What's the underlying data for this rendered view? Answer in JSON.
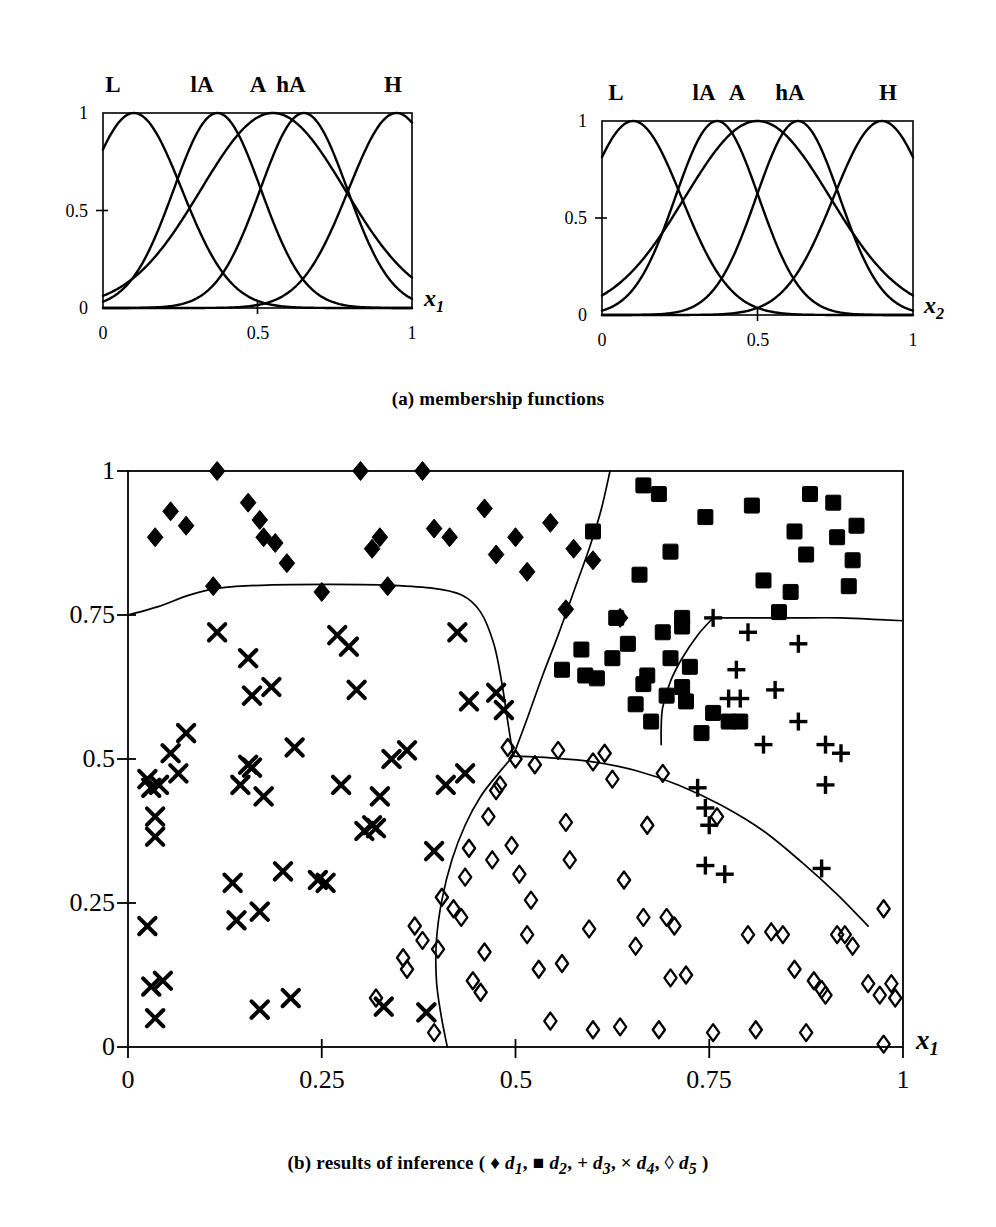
{
  "figure": {
    "caption_a": "(a) membership functions",
    "caption_b_prefix": "(b) results of  inference ( ",
    "caption_b_suffix": " )",
    "caption_b_full": "(b) results of inference ( ♦ d1, ■ d2, + d3, × d4, ◊ d5 )"
  },
  "membership_panels": [
    {
      "name": "membership-x1",
      "axis_label": "x",
      "axis_sub": "1",
      "y_ticks": [
        "0",
        "0.5",
        "1"
      ],
      "y_tick_values": [
        0,
        0.5,
        1
      ],
      "x_ticks": [
        "0",
        "0.5",
        "1"
      ],
      "x_tick_values": [
        0,
        0.5,
        1
      ],
      "set_labels": [
        "L",
        "lA",
        "A",
        "hA",
        "H"
      ],
      "set_label_positions": [
        0.09,
        0.37,
        0.52,
        0.64,
        0.94
      ],
      "centers": [
        0.1,
        0.37,
        0.55,
        0.65,
        0.95
      ],
      "widths": [
        0.22,
        0.2,
        0.33,
        0.2,
        0.22
      ]
    },
    {
      "name": "membership-x2",
      "axis_label": "x",
      "axis_sub": "2",
      "y_ticks": [
        "0",
        "0.5",
        "1"
      ],
      "y_tick_values": [
        0,
        0.5,
        1
      ],
      "x_ticks": [
        "0",
        "0.5",
        "1"
      ],
      "x_tick_values": [
        0,
        0.5,
        1
      ],
      "set_labels": [
        "L",
        "lA",
        "A",
        "hA",
        "H"
      ],
      "set_label_positions": [
        0.1,
        0.37,
        0.47,
        0.62,
        0.9
      ],
      "centers": [
        0.1,
        0.37,
        0.5,
        0.63,
        0.9
      ],
      "widths": [
        0.22,
        0.19,
        0.33,
        0.19,
        0.22
      ]
    }
  ],
  "chart_data": {
    "type": "scatter",
    "title": "",
    "xlabel": "x1",
    "ylabel": "x2",
    "xlim": [
      0,
      1
    ],
    "ylim": [
      0,
      1
    ],
    "grid": false,
    "x_ticks": [
      "0",
      "0.25",
      "0.5",
      "0.75",
      "1"
    ],
    "x_tick_values": [
      0,
      0.25,
      0.5,
      0.75,
      1
    ],
    "y_ticks": [
      "0",
      "0.25",
      "0.5",
      "0.75",
      "1"
    ],
    "y_tick_values": [
      0,
      0.25,
      0.5,
      0.75,
      1
    ],
    "legend_position": "below",
    "series": [
      {
        "name": "d1",
        "label": "d1",
        "marker": "filled-diamond",
        "color": "#000000",
        "points": [
          [
            0.035,
            0.885
          ],
          [
            0.055,
            0.93
          ],
          [
            0.075,
            0.905
          ],
          [
            0.11,
            0.8
          ],
          [
            0.115,
            1.0
          ],
          [
            0.155,
            0.945
          ],
          [
            0.17,
            0.915
          ],
          [
            0.175,
            0.885
          ],
          [
            0.19,
            0.875
          ],
          [
            0.205,
            0.84
          ],
          [
            0.25,
            0.79
          ],
          [
            0.3,
            1.0
          ],
          [
            0.315,
            0.865
          ],
          [
            0.325,
            0.885
          ],
          [
            0.335,
            0.8
          ],
          [
            0.38,
            1.0
          ],
          [
            0.395,
            0.9
          ],
          [
            0.415,
            0.885
          ],
          [
            0.46,
            0.935
          ],
          [
            0.475,
            0.855
          ],
          [
            0.5,
            0.885
          ],
          [
            0.515,
            0.825
          ],
          [
            0.545,
            0.91
          ],
          [
            0.565,
            0.76
          ],
          [
            0.575,
            0.865
          ],
          [
            0.635,
            0.745
          ],
          [
            0.6,
            0.845
          ]
        ]
      },
      {
        "name": "d2",
        "label": "d2",
        "marker": "filled-square",
        "color": "#000000",
        "points": [
          [
            0.6,
            0.895
          ],
          [
            0.605,
            0.64
          ],
          [
            0.625,
            0.675
          ],
          [
            0.645,
            0.7
          ],
          [
            0.655,
            0.595
          ],
          [
            0.66,
            0.82
          ],
          [
            0.665,
            0.975
          ],
          [
            0.665,
            0.63
          ],
          [
            0.67,
            0.645
          ],
          [
            0.675,
            0.565
          ],
          [
            0.685,
            0.96
          ],
          [
            0.69,
            0.72
          ],
          [
            0.695,
            0.61
          ],
          [
            0.7,
            0.675
          ],
          [
            0.7,
            0.86
          ],
          [
            0.715,
            0.73
          ],
          [
            0.715,
            0.625
          ],
          [
            0.72,
            0.6
          ],
          [
            0.725,
            0.66
          ],
          [
            0.74,
            0.545
          ],
          [
            0.745,
            0.92
          ],
          [
            0.755,
            0.58
          ],
          [
            0.775,
            0.565
          ],
          [
            0.79,
            0.565
          ],
          [
            0.805,
            0.94
          ],
          [
            0.82,
            0.81
          ],
          [
            0.84,
            0.755
          ],
          [
            0.855,
            0.79
          ],
          [
            0.86,
            0.895
          ],
          [
            0.875,
            0.855
          ],
          [
            0.88,
            0.96
          ],
          [
            0.91,
            0.945
          ],
          [
            0.915,
            0.885
          ],
          [
            0.93,
            0.8
          ],
          [
            0.935,
            0.845
          ],
          [
            0.94,
            0.905
          ],
          [
            0.56,
            0.655
          ],
          [
            0.585,
            0.69
          ],
          [
            0.59,
            0.645
          ],
          [
            0.63,
            0.745
          ],
          [
            0.715,
            0.745
          ]
        ]
      },
      {
        "name": "d3",
        "label": "d3",
        "marker": "plus",
        "color": "#000000",
        "points": [
          [
            0.755,
            0.745
          ],
          [
            0.8,
            0.72
          ],
          [
            0.785,
            0.655
          ],
          [
            0.835,
            0.62
          ],
          [
            0.775,
            0.605
          ],
          [
            0.79,
            0.605
          ],
          [
            0.865,
            0.7
          ],
          [
            0.865,
            0.565
          ],
          [
            0.82,
            0.525
          ],
          [
            0.9,
            0.525
          ],
          [
            0.9,
            0.455
          ],
          [
            0.92,
            0.51
          ],
          [
            0.735,
            0.45
          ],
          [
            0.745,
            0.415
          ],
          [
            0.75,
            0.385
          ],
          [
            0.745,
            0.315
          ],
          [
            0.77,
            0.3
          ],
          [
            0.895,
            0.31
          ]
        ]
      },
      {
        "name": "d4",
        "label": "d4",
        "marker": "cross",
        "color": "#000000",
        "points": [
          [
            0.025,
            0.465
          ],
          [
            0.03,
            0.45
          ],
          [
            0.04,
            0.455
          ],
          [
            0.035,
            0.4
          ],
          [
            0.035,
            0.365
          ],
          [
            0.025,
            0.21
          ],
          [
            0.03,
            0.105
          ],
          [
            0.045,
            0.115
          ],
          [
            0.035,
            0.05
          ],
          [
            0.055,
            0.51
          ],
          [
            0.065,
            0.475
          ],
          [
            0.075,
            0.545
          ],
          [
            0.115,
            0.72
          ],
          [
            0.135,
            0.285
          ],
          [
            0.14,
            0.22
          ],
          [
            0.145,
            0.455
          ],
          [
            0.155,
            0.675
          ],
          [
            0.155,
            0.49
          ],
          [
            0.16,
            0.61
          ],
          [
            0.16,
            0.485
          ],
          [
            0.17,
            0.235
          ],
          [
            0.17,
            0.065
          ],
          [
            0.175,
            0.435
          ],
          [
            0.185,
            0.625
          ],
          [
            0.2,
            0.305
          ],
          [
            0.21,
            0.085
          ],
          [
            0.215,
            0.52
          ],
          [
            0.245,
            0.29
          ],
          [
            0.255,
            0.285
          ],
          [
            0.27,
            0.715
          ],
          [
            0.275,
            0.455
          ],
          [
            0.285,
            0.695
          ],
          [
            0.295,
            0.62
          ],
          [
            0.305,
            0.375
          ],
          [
            0.315,
            0.385
          ],
          [
            0.32,
            0.38
          ],
          [
            0.325,
            0.435
          ],
          [
            0.33,
            0.07
          ],
          [
            0.34,
            0.5
          ],
          [
            0.36,
            0.515
          ],
          [
            0.385,
            0.06
          ],
          [
            0.395,
            0.34
          ],
          [
            0.41,
            0.455
          ],
          [
            0.425,
            0.72
          ],
          [
            0.435,
            0.475
          ],
          [
            0.44,
            0.6
          ],
          [
            0.475,
            0.615
          ],
          [
            0.485,
            0.585
          ]
        ]
      },
      {
        "name": "d5",
        "label": "d5",
        "marker": "open-diamond",
        "color": "#000000",
        "points": [
          [
            0.355,
            0.155
          ],
          [
            0.36,
            0.135
          ],
          [
            0.37,
            0.21
          ],
          [
            0.38,
            0.185
          ],
          [
            0.395,
            0.025
          ],
          [
            0.4,
            0.17
          ],
          [
            0.405,
            0.26
          ],
          [
            0.42,
            0.24
          ],
          [
            0.43,
            0.225
          ],
          [
            0.435,
            0.295
          ],
          [
            0.44,
            0.345
          ],
          [
            0.445,
            0.115
          ],
          [
            0.455,
            0.095
          ],
          [
            0.46,
            0.165
          ],
          [
            0.465,
            0.4
          ],
          [
            0.47,
            0.325
          ],
          [
            0.475,
            0.445
          ],
          [
            0.48,
            0.455
          ],
          [
            0.49,
            0.52
          ],
          [
            0.495,
            0.35
          ],
          [
            0.5,
            0.5
          ],
          [
            0.505,
            0.3
          ],
          [
            0.515,
            0.195
          ],
          [
            0.52,
            0.255
          ],
          [
            0.525,
            0.49
          ],
          [
            0.53,
            0.135
          ],
          [
            0.545,
            0.045
          ],
          [
            0.555,
            0.515
          ],
          [
            0.56,
            0.145
          ],
          [
            0.565,
            0.39
          ],
          [
            0.57,
            0.325
          ],
          [
            0.595,
            0.205
          ],
          [
            0.6,
            0.03
          ],
          [
            0.6,
            0.495
          ],
          [
            0.615,
            0.51
          ],
          [
            0.625,
            0.465
          ],
          [
            0.635,
            0.035
          ],
          [
            0.64,
            0.29
          ],
          [
            0.655,
            0.175
          ],
          [
            0.665,
            0.225
          ],
          [
            0.67,
            0.385
          ],
          [
            0.685,
            0.03
          ],
          [
            0.69,
            0.475
          ],
          [
            0.695,
            0.225
          ],
          [
            0.7,
            0.12
          ],
          [
            0.705,
            0.21
          ],
          [
            0.72,
            0.125
          ],
          [
            0.755,
            0.025
          ],
          [
            0.76,
            0.4
          ],
          [
            0.8,
            0.195
          ],
          [
            0.81,
            0.03
          ],
          [
            0.83,
            0.2
          ],
          [
            0.845,
            0.195
          ],
          [
            0.86,
            0.135
          ],
          [
            0.875,
            0.025
          ],
          [
            0.885,
            0.115
          ],
          [
            0.895,
            0.1
          ],
          [
            0.9,
            0.09
          ],
          [
            0.915,
            0.195
          ],
          [
            0.925,
            0.195
          ],
          [
            0.935,
            0.175
          ],
          [
            0.955,
            0.11
          ],
          [
            0.97,
            0.09
          ],
          [
            0.975,
            0.005
          ],
          [
            0.985,
            0.11
          ],
          [
            0.975,
            0.24
          ],
          [
            0.99,
            0.085
          ],
          [
            0.32,
            0.085
          ]
        ]
      }
    ],
    "boundaries": [
      {
        "name": "d1-d4-boundary",
        "path": [
          [
            0.0,
            0.75
          ],
          [
            0.04,
            0.765
          ],
          [
            0.08,
            0.785
          ],
          [
            0.12,
            0.797
          ],
          [
            0.18,
            0.802
          ],
          [
            0.26,
            0.803
          ],
          [
            0.33,
            0.802
          ],
          [
            0.39,
            0.797
          ],
          [
            0.43,
            0.785
          ],
          [
            0.455,
            0.755
          ],
          [
            0.472,
            0.7
          ],
          [
            0.482,
            0.635
          ],
          [
            0.49,
            0.565
          ],
          [
            0.497,
            0.505
          ]
        ]
      },
      {
        "name": "d1-d2-boundary",
        "path": [
          [
            0.497,
            0.505
          ],
          [
            0.515,
            0.57
          ],
          [
            0.535,
            0.645
          ],
          [
            0.555,
            0.715
          ],
          [
            0.575,
            0.79
          ],
          [
            0.595,
            0.865
          ],
          [
            0.61,
            0.93
          ],
          [
            0.622,
            1.0
          ]
        ]
      },
      {
        "name": "d4-d5-boundary",
        "path": [
          [
            0.497,
            0.505
          ],
          [
            0.478,
            0.475
          ],
          [
            0.455,
            0.435
          ],
          [
            0.435,
            0.385
          ],
          [
            0.418,
            0.325
          ],
          [
            0.405,
            0.255
          ],
          [
            0.398,
            0.185
          ],
          [
            0.398,
            0.115
          ],
          [
            0.404,
            0.055
          ],
          [
            0.412,
            0.0
          ]
        ]
      },
      {
        "name": "d2-d5-boundary",
        "path": [
          [
            0.497,
            0.505
          ],
          [
            0.545,
            0.502
          ],
          [
            0.6,
            0.495
          ],
          [
            0.655,
            0.48
          ],
          [
            0.71,
            0.455
          ],
          [
            0.765,
            0.42
          ],
          [
            0.82,
            0.375
          ],
          [
            0.87,
            0.32
          ],
          [
            0.915,
            0.265
          ],
          [
            0.955,
            0.21
          ]
        ]
      },
      {
        "name": "d2-d3-boundary",
        "path": [
          [
            0.755,
            0.745
          ],
          [
            0.735,
            0.715
          ],
          [
            0.715,
            0.675
          ],
          [
            0.7,
            0.635
          ],
          [
            0.69,
            0.59
          ],
          [
            0.688,
            0.555
          ],
          [
            0.688,
            0.525
          ]
        ]
      },
      {
        "name": "d3-top-boundary",
        "path": [
          [
            0.755,
            0.745
          ],
          [
            0.8,
            0.745
          ],
          [
            0.86,
            0.745
          ],
          [
            0.92,
            0.745
          ],
          [
            0.97,
            0.742
          ],
          [
            1.0,
            0.74
          ]
        ]
      }
    ]
  },
  "legend": [
    {
      "symbol": "♦",
      "label_prefix": "d",
      "label_sub": "1",
      "sep": ","
    },
    {
      "symbol": "■",
      "label_prefix": "d",
      "label_sub": "2",
      "sep": ","
    },
    {
      "symbol": "+",
      "label_prefix": "d",
      "label_sub": "3",
      "sep": ","
    },
    {
      "symbol": "×",
      "label_prefix": "d",
      "label_sub": "4",
      "sep": ","
    },
    {
      "symbol": "◊",
      "label_prefix": "d",
      "label_sub": "5",
      "sep": ""
    }
  ],
  "colors": {
    "ink": "#000000",
    "background": "#ffffff"
  }
}
